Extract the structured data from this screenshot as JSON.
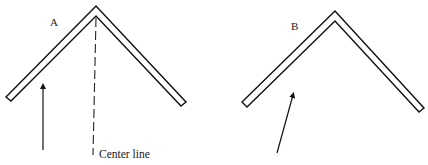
{
  "figures": [
    {
      "label": "A",
      "annotation": "Center line",
      "outer": [
        [
          6,
          97
        ],
        [
          96,
          6
        ],
        [
          186,
          102
        ]
      ],
      "inner": [
        [
          11,
          101
        ],
        [
          96,
          16
        ],
        [
          181,
          106
        ]
      ],
      "arrow": {
        "from": [
          43,
          150
        ],
        "to": [
          43,
          84
        ]
      },
      "center_line": {
        "x": 96,
        "y1": 18,
        "y2": 155
      }
    },
    {
      "label": "B",
      "arrow": {
        "from": [
          277,
          153
        ],
        "to": [
          294,
          92
        ]
      },
      "outer": [
        [
          242,
          102
        ],
        [
          335,
          11
        ],
        [
          424,
          108
        ]
      ],
      "inner": [
        [
          247,
          107
        ],
        [
          335,
          21
        ],
        [
          419,
          112
        ]
      ]
    }
  ],
  "colors": {
    "stroke": "#111111",
    "background": "#ffffff"
  }
}
